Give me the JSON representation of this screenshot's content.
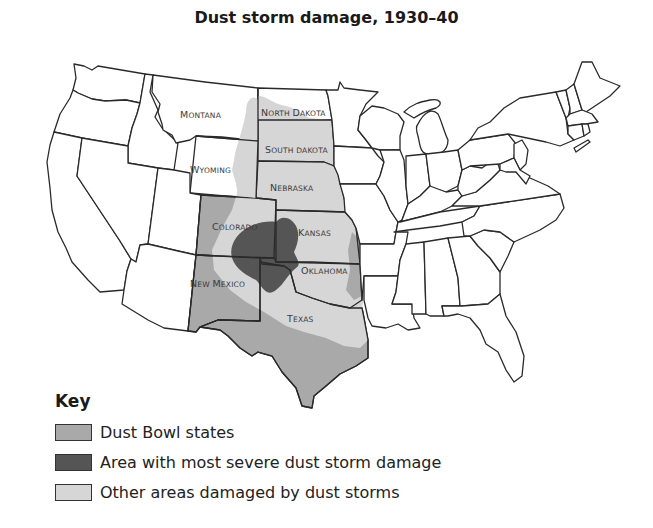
{
  "title": "Dust storm damage, 1930–40",
  "colors": {
    "dust_bowl_states": "#a9a9a9",
    "most_severe": "#555555",
    "other_damaged": "#d6d6d6",
    "unaffected": "#ffffff",
    "border": "#2a2a2a"
  },
  "state_labels": {
    "montana": {
      "first": "M",
      "rest": "ONTANA"
    },
    "north_dakota": {
      "first": "N",
      "rest": "ORTH ",
      "first2": "D",
      "rest2": "AKOTA"
    },
    "south_dakota": {
      "first": "S",
      "rest": "OUTH DAKOTA"
    },
    "wyoming": {
      "first": "W",
      "rest": "YOMING"
    },
    "nebraska": {
      "first": "N",
      "rest": "EBRASKA"
    },
    "colorado": {
      "first": "C",
      "rest": "OLORADO"
    },
    "kansas": {
      "first": "K",
      "rest": "ANSAS"
    },
    "oklahoma": {
      "first": "O",
      "rest": "KLAHOMA"
    },
    "new_mexico": {
      "first": "N",
      "rest": "EW ",
      "first2": "M",
      "rest2": "EXICO"
    },
    "texas": {
      "first": "T",
      "rest": "EXAS"
    }
  },
  "key": {
    "title": "Key",
    "items": [
      {
        "label": "Dust Bowl states",
        "color": "#a9a9a9"
      },
      {
        "label": "Area with most severe dust storm damage",
        "color": "#555555"
      },
      {
        "label": "Other areas damaged by dust storms",
        "color": "#d6d6d6"
      }
    ]
  }
}
